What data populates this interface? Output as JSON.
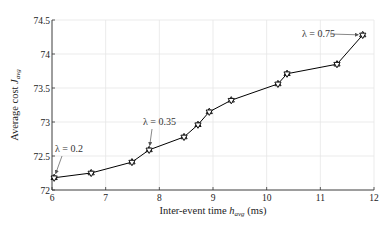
{
  "chart_data": {
    "type": "line",
    "title": "",
    "xlabel": "Inter-event time h_avg (ms)",
    "ylabel": "Average cost J_avg",
    "xlabel_parts": {
      "main": "Inter-event time ",
      "var": "h",
      "sub": "avg",
      "unit": " (ms)"
    },
    "ylabel_parts": {
      "main": "Average cost ",
      "var": "J",
      "sub": "avg"
    },
    "xlim": [
      6,
      12
    ],
    "ylim": [
      72,
      74.5
    ],
    "xticks": [
      6,
      7,
      8,
      9,
      10,
      11,
      12
    ],
    "yticks": [
      72,
      72.5,
      73,
      73.5,
      74,
      74.5
    ],
    "xtick_labels": [
      "6",
      "7",
      "8",
      "9",
      "10",
      "11",
      "12"
    ],
    "ytick_labels": [
      "72",
      "72.5",
      "73",
      "73.5",
      "74",
      "74.5"
    ],
    "grid": true,
    "legend": null,
    "series": [
      {
        "name": "Average cost",
        "marker": "hexagram",
        "color": "#000000",
        "x": [
          6.04,
          6.73,
          7.49,
          7.81,
          8.46,
          8.72,
          8.93,
          9.34,
          10.21,
          10.38,
          11.31,
          11.79
        ],
        "y": [
          72.18,
          72.25,
          72.41,
          72.59,
          72.78,
          72.96,
          73.15,
          73.32,
          73.56,
          73.71,
          73.85,
          74.28
        ]
      }
    ],
    "annotations": [
      {
        "text": "λ = 0.2",
        "point_index": 0
      },
      {
        "text": "λ = 0.35",
        "point_index": 3
      },
      {
        "text": "λ = 0.75",
        "point_index": 11
      }
    ]
  },
  "colors": {
    "line": "#000000",
    "grid": "#e6e6e6",
    "axis": "#333333",
    "annotation": "#555555"
  }
}
